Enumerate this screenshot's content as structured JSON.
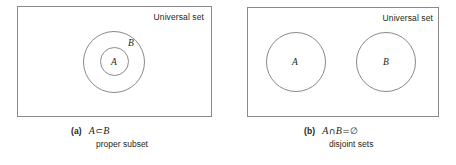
{
  "figure": {
    "panels": [
      {
        "id": "panel-a",
        "universal_label": "Universal set",
        "sets": [
          {
            "name": "B",
            "label": "B"
          },
          {
            "name": "A",
            "label": "A"
          }
        ],
        "caption": {
          "tag": "(a)",
          "expression_left": "A",
          "operator": "⊂",
          "expression_right": "B",
          "description": "proper subset"
        }
      },
      {
        "id": "panel-b",
        "universal_label": "Universal set",
        "sets": [
          {
            "name": "A",
            "label": "A"
          },
          {
            "name": "B",
            "label": "B"
          }
        ],
        "caption": {
          "tag": "(b)",
          "expression_left": "A",
          "operator": "∩",
          "expression_right": "B",
          "equals": "=",
          "empty_set": "∅",
          "description": "disjoint sets"
        }
      }
    ],
    "colors": {
      "stroke": "#8a8a8a",
      "text": "#231f20",
      "background": "#ffffff"
    }
  }
}
